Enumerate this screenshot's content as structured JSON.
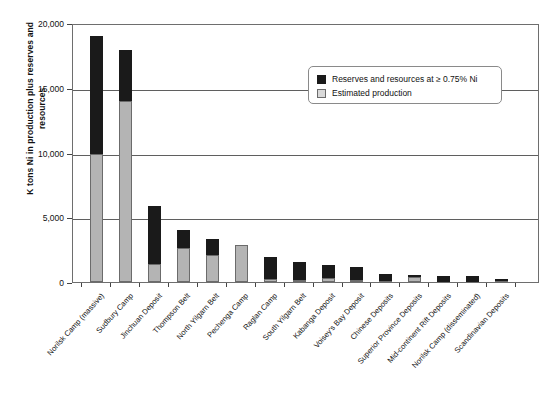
{
  "chart_data": {
    "type": "bar",
    "title": "",
    "xlabel": "",
    "ylabel": "K tons Ni in production plus reserves and resources",
    "ylim": [
      0,
      20000
    ],
    "yticks": [
      "0",
      "5,000",
      "10,000",
      "15,000",
      "20,000"
    ],
    "ytick_values": [
      0,
      5000,
      10000,
      15000,
      20000
    ],
    "grid": true,
    "stacked": true,
    "legend_position": "top-right",
    "categories": [
      "Norilsk Camp (massive)",
      "Sudbury Camp",
      "Jinchuan Deposit",
      "Thompson Belt",
      "North Yilgarn Belt",
      "Pechenga Camp",
      "Raglan Camp",
      "South Yilgarn Belt",
      "Kabanga Deposit",
      "Voisey's Bay Deposit",
      "Chinese Deposits",
      "Superior Province Deposits",
      "Mid-continent Rift Deposits",
      "Norilsk Camp (disseminated)",
      "Scandinavian Deposits"
    ],
    "series": [
      {
        "name": "Estimated production",
        "color": "#b4b4b4",
        "values": [
          9900,
          14000,
          1400,
          2600,
          2100,
          2850,
          200,
          150,
          300,
          150,
          100,
          350,
          0,
          0,
          100
        ]
      },
      {
        "name": "Reserves and resources at ≥ 0.75% Ni",
        "color": "#1a1a1a",
        "values": [
          9100,
          3900,
          4500,
          1400,
          1200,
          0,
          1750,
          1400,
          1000,
          1000,
          500,
          150,
          450,
          500,
          50
        ]
      }
    ],
    "totals": [
      19000,
      17900,
      5900,
      4000,
      3300,
      2850,
      1950,
      1550,
      1300,
      1150,
      600,
      500,
      450,
      500,
      150
    ]
  },
  "legend": {
    "items": [
      {
        "label": "Reserves and resources at ≥ 0.75% Ni",
        "swatch": "black-square-icon"
      },
      {
        "label": "Estimated production",
        "swatch": "open-square-icon"
      }
    ]
  }
}
